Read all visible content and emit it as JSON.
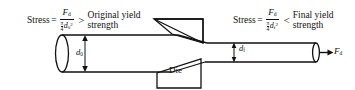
{
  "figure": {
    "background_color": "#ffffff",
    "line_color": "#111111"
  },
  "left_formula": {
    "lead": "Stress",
    "equals": "=",
    "numerator": "F",
    "numerator_sub": "d",
    "denominator_coeff_num": "π",
    "denominator_coeff_den": "4",
    "denominator_var": "d",
    "denominator_sub": "0",
    "denominator_sup": "2",
    "relation": ">",
    "comparison_line1": "Original yield",
    "comparison_line2": "strength"
  },
  "right_formula": {
    "lead": "Stress",
    "equals": "=",
    "numerator": "F",
    "numerator_sub": "d",
    "denominator_coeff_num": "π",
    "denominator_coeff_den": "4",
    "denominator_var": "d",
    "denominator_sub": "f",
    "denominator_sup": "2",
    "relation": "<",
    "comparison_line1": "Final yield",
    "comparison_line2": "strength"
  },
  "labels": {
    "initial_diameter": "d",
    "initial_diameter_sub": "0",
    "final_diameter": "d",
    "final_diameter_sub": "f",
    "die": "Die",
    "draw_force": "F",
    "draw_force_sub": "d"
  }
}
